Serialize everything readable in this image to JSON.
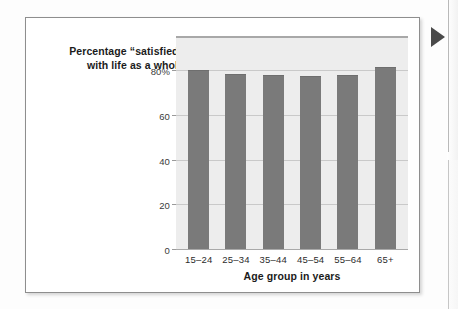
{
  "figure": {
    "title_lines": [
      "Percentage “satisfied”",
      "with life as a whole"
    ],
    "marker_icon": "play-triangle-icon",
    "frame_color": "#8e8e8e",
    "plot_background": "#ededed",
    "bar_color": "#7a7a7a",
    "gridline_color": "#c9c9c9"
  },
  "chart_data": {
    "type": "bar",
    "title": "Percentage “satisfied” with life as a whole",
    "categories": [
      "15–24",
      "25–34",
      "35–44",
      "45–54",
      "55–64",
      "65+"
    ],
    "values": [
      80.5,
      79,
      78.5,
      78,
      78.5,
      82
    ],
    "xlabel": "Age group in years",
    "ylabel": "",
    "ylim": [
      0,
      95
    ],
    "yticks": [
      0,
      20,
      40,
      60,
      80
    ],
    "ytick_labels": [
      "0",
      "20",
      "40",
      "60",
      "80%"
    ],
    "grid": true,
    "legend": false,
    "series": [
      {
        "name": "Percentage satisfied with life as a whole",
        "values": [
          80.5,
          79,
          78.5,
          78,
          78.5,
          82
        ]
      }
    ]
  }
}
